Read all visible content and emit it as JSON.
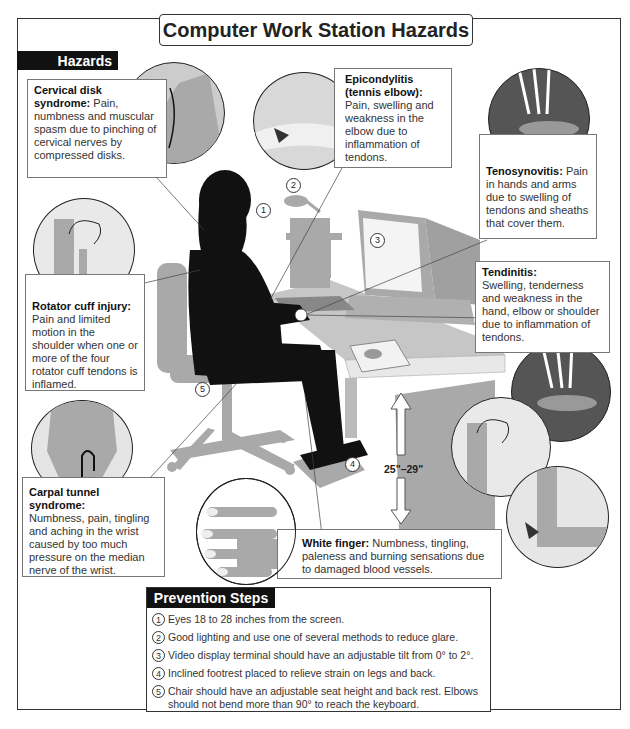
{
  "title": "Computer Work Station Hazards",
  "hazards_header": "Hazards",
  "hazards": [
    {
      "name": "Cervical disk syndrome:",
      "description": "Pain, numbness and muscular spasm due to pinching of cervical nerves by compressed disks."
    },
    {
      "name": "Epicondylitis (tennis elbow):",
      "description": "Pain, swelling and weakness in the elbow due to inflammation of tendons."
    },
    {
      "name": "Tenosynovitis:",
      "description": "Pain in hands and arms due to swelling of tendons and sheaths that cover them."
    },
    {
      "name": "Rotator cuff injury:",
      "description": "Pain and limited motion in the shoulder when one or more of the four rotator cuff tendons is inflamed."
    },
    {
      "name": "Tendinitis:",
      "description": "Swelling, tenderness and weakness in the hand, elbow or shoulder due to inflammation of tendons."
    },
    {
      "name": "Carpal tunnel syndrome:",
      "description": "Numbness, pain, tingling and aching in the wrist caused by too much pressure on the median nerve of the wrist."
    },
    {
      "name": "White finger:",
      "description": "Numbness, tingling, paleness and burning sensations due to damaged blood vessels."
    }
  ],
  "diagram_markers": [
    "1",
    "2",
    "3",
    "4",
    "5"
  ],
  "desk_height": "25\"–29\"",
  "prevention_header": "Prevention Steps",
  "prevention_steps": [
    {
      "num": "1",
      "text": "Eyes 18 to 28 inches from the screen."
    },
    {
      "num": "2",
      "text": "Good lighting and use one of several methods to reduce glare."
    },
    {
      "num": "3",
      "text": "Video display terminal should have an adjustable tilt from 0° to 2°."
    },
    {
      "num": "4",
      "text": "Inclined footrest placed to relieve strain on legs and back."
    },
    {
      "num": "5",
      "text": "Chair should have an adjustable seat height and back rest. Elbows should not bend more than 90° to reach the keyboard."
    }
  ],
  "colors": {
    "silhouette": "#111111",
    "furniture": "#a9a9a9",
    "tab_background": "#111111",
    "border": "#333333"
  }
}
